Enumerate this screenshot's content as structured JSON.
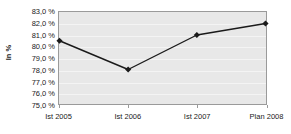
{
  "chart_data": {
    "type": "line",
    "title": "",
    "subtitle": "",
    "xlabel": "",
    "ylabel": "In %",
    "categories": [
      "Ist 2005",
      "Ist 2006",
      "Ist 2007",
      "Plan 2008"
    ],
    "values": [
      80.5,
      78.0,
      81.0,
      82.0
    ],
    "series": [
      {
        "name": "In %",
        "values": [
          80.5,
          78.0,
          81.0,
          82.0
        ]
      }
    ],
    "ylim": [
      75.0,
      83.0
    ],
    "ytick_step": 1.0,
    "ytick_labels": [
      "83,0 %",
      "82,0 %",
      "81,0 %",
      "80,0 %",
      "79,0 %",
      "78,0 %",
      "77,0 %",
      "76,0 %",
      "75,0 %"
    ],
    "ytick_values": [
      83.0,
      82.0,
      81.0,
      80.0,
      79.0,
      78.0,
      77.0,
      76.0,
      75.0
    ],
    "grid": true,
    "grid_axis": "y",
    "legend": false,
    "legend_position": "none",
    "marker": "diamond",
    "colors": {
      "line": "#1a1a1a",
      "marker": "#1a1a1a",
      "plot_background": "#e8e8e8",
      "gridline": "#f4f4f4",
      "axis": "#9a9a9a",
      "text": "#1a1a1a",
      "page_background": "#ffffff"
    }
  }
}
